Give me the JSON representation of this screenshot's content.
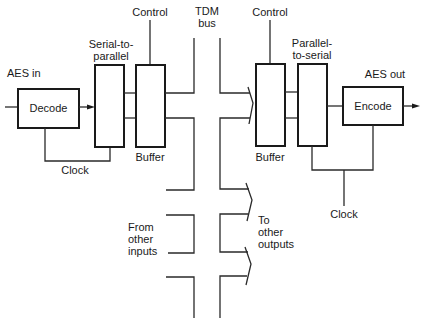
{
  "diagram": {
    "type": "block-diagram",
    "labels": {
      "aes_in": "AES in",
      "aes_out": "AES out",
      "tdm_bus_line1": "TDM",
      "tdm_bus_line2": "bus",
      "control_left": "Control",
      "control_right": "Control",
      "clock_left": "Clock",
      "clock_right": "Clock",
      "buffer_left": "Buffer",
      "buffer_right": "Buffer",
      "serial_to_parallel_line1": "Serial-to-",
      "serial_to_parallel_line2": "parallel",
      "parallel_to_serial_line1": "Parallel-",
      "parallel_to_serial_line2": "to-serial",
      "from_other_inputs_line1": "From",
      "from_other_inputs_line2": "other",
      "from_other_inputs_line3": "inputs",
      "to_other_outputs_line1": "To",
      "to_other_outputs_line2": "other",
      "to_other_outputs_line3": "outputs"
    },
    "blocks": {
      "decode": "Decode",
      "encode": "Encode"
    },
    "nodes": [
      {
        "id": "decode",
        "label": "Decode"
      },
      {
        "id": "serial-to-parallel",
        "label": "Serial-to-parallel"
      },
      {
        "id": "buffer-in",
        "label": "Buffer"
      },
      {
        "id": "tdm-bus",
        "label": "TDM bus"
      },
      {
        "id": "buffer-out",
        "label": "Buffer"
      },
      {
        "id": "parallel-to-serial",
        "label": "Parallel-to-serial"
      },
      {
        "id": "encode",
        "label": "Encode"
      }
    ],
    "edges": [
      {
        "from": "AES in",
        "to": "decode"
      },
      {
        "from": "decode",
        "to": "serial-to-parallel"
      },
      {
        "from": "decode",
        "to": "serial-to-parallel",
        "label": "Clock"
      },
      {
        "from": "serial-to-parallel",
        "to": "buffer-in"
      },
      {
        "from": "Control",
        "to": "buffer-in"
      },
      {
        "from": "buffer-in",
        "to": "tdm-bus"
      },
      {
        "from": "From other inputs",
        "to": "tdm-bus"
      },
      {
        "from": "tdm-bus",
        "to": "buffer-out"
      },
      {
        "from": "tdm-bus",
        "to": "To other outputs"
      },
      {
        "from": "Control",
        "to": "buffer-out"
      },
      {
        "from": "buffer-out",
        "to": "parallel-to-serial"
      },
      {
        "from": "parallel-to-serial",
        "to": "encode"
      },
      {
        "from": "Clock",
        "to": "parallel-to-serial"
      },
      {
        "from": "Clock",
        "to": "encode"
      },
      {
        "from": "encode",
        "to": "AES out"
      }
    ]
  }
}
